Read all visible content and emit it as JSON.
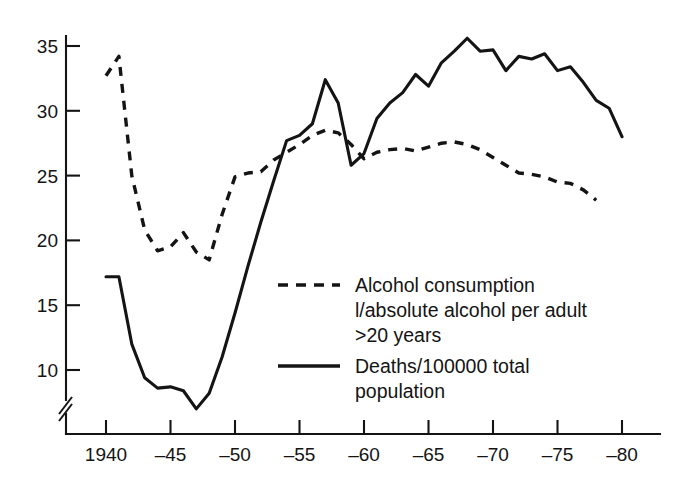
{
  "chart_data": {
    "type": "line",
    "title": "",
    "subtitle": "",
    "xlabel": "",
    "ylabel": "",
    "xlim": [
      1939,
      1981
    ],
    "ylim": [
      6.2,
      36.5
    ],
    "grid": false,
    "legend_position": "center-right-inside",
    "x_ticks": [
      1940,
      1945,
      1950,
      1955,
      1960,
      1965,
      1970,
      1975,
      1980
    ],
    "x_tick_labels": [
      "1940",
      "–45",
      "–50",
      "–55",
      "–60",
      "–65",
      "–70",
      "–75",
      "–80"
    ],
    "y_ticks": [
      10,
      15,
      20,
      25,
      30,
      35
    ],
    "y_tick_labels": [
      "10",
      "15",
      "20",
      "25",
      "30",
      "35"
    ],
    "y_axis_break": true,
    "series": [
      {
        "name": "Alcohol consumption l/absolute alcohol per adult >20 years",
        "style": "dashed",
        "color": "#141414",
        "x": [
          1940,
          1941,
          1942,
          1943,
          1944,
          1945,
          1946,
          1947,
          1948,
          1949,
          1950,
          1951,
          1952,
          1953,
          1954,
          1955,
          1956,
          1957,
          1958,
          1959,
          1960,
          1961,
          1962,
          1963,
          1964,
          1965,
          1966,
          1967,
          1968,
          1969,
          1970,
          1971,
          1972,
          1973,
          1974,
          1975,
          1976,
          1977,
          1978
        ],
        "values": [
          32.7,
          34.2,
          25.0,
          20.8,
          19.2,
          19.5,
          20.6,
          19.1,
          18.5,
          22.0,
          24.9,
          25.2,
          25.3,
          26.2,
          26.8,
          27.4,
          28.1,
          28.5,
          28.3,
          27.4,
          26.3,
          26.8,
          27.0,
          27.1,
          26.9,
          27.2,
          27.5,
          27.6,
          27.4,
          27.0,
          26.4,
          25.8,
          25.2,
          25.1,
          24.9,
          24.5,
          24.4,
          23.9,
          23.1
        ]
      },
      {
        "name": "Deaths/100000 total population",
        "style": "solid",
        "color": "#141414",
        "x": [
          1940,
          1941,
          1942,
          1943,
          1944,
          1945,
          1946,
          1947,
          1948,
          1949,
          1950,
          1951,
          1952,
          1953,
          1954,
          1955,
          1956,
          1957,
          1958,
          1959,
          1960,
          1961,
          1962,
          1963,
          1964,
          1965,
          1966,
          1967,
          1968,
          1969,
          1970,
          1971,
          1972,
          1973,
          1974,
          1975,
          1976,
          1977,
          1978,
          1979,
          1980
        ],
        "values": [
          17.2,
          17.2,
          12.0,
          9.4,
          8.6,
          8.7,
          8.4,
          7.0,
          8.2,
          11.0,
          14.4,
          18.0,
          21.4,
          24.6,
          27.7,
          28.1,
          29.0,
          32.4,
          30.6,
          25.8,
          26.7,
          29.4,
          30.6,
          31.4,
          32.8,
          31.9,
          33.7,
          34.6,
          35.6,
          34.6,
          34.7,
          33.1,
          34.2,
          34.0,
          34.4,
          33.1,
          33.4,
          32.2,
          30.8,
          30.2,
          28.0
        ]
      }
    ]
  },
  "legend": {
    "entries": [
      {
        "swatch": "dashed-line-swatch",
        "lines": [
          "Alcohol consumption",
          "l/absolute alcohol per adult",
          ">20 years"
        ]
      },
      {
        "swatch": "solid-line-swatch",
        "lines": [
          "Deaths/100000 total",
          "population"
        ]
      }
    ]
  },
  "colors": {
    "ink": "#141414",
    "background": "#ffffff"
  }
}
